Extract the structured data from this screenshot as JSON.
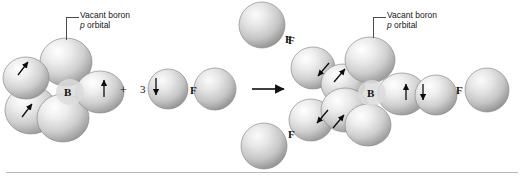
{
  "diagram": {
    "type": "orbital-reaction-diagram",
    "background": "#ffffff",
    "rule_color": "#b9b9b9"
  },
  "callouts": [
    {
      "id": "left",
      "line1": "Vacant boron",
      "line2_italic": "p",
      "line2_rest": " orbital"
    },
    {
      "id": "right",
      "line1": "Vacant boron",
      "line2_italic": "p",
      "line2_rest": " orbital"
    }
  ],
  "reactants": {
    "boron": {
      "symbol": "B",
      "hybridization": "sp2",
      "unpaired_lobes": 3,
      "vacant_p_orbitals": 1
    },
    "plus_sign": "+",
    "coefficient": "3",
    "fluorine": {
      "symbol": "F",
      "unpaired_electrons": 1
    }
  },
  "reaction_arrow": {
    "direction": "right",
    "color": "#111111"
  },
  "products": {
    "boron": {
      "symbol": "B"
    },
    "fluorines": [
      {
        "symbol": "F",
        "position": "top"
      },
      {
        "symbol": "F",
        "position": "upper-left"
      },
      {
        "symbol": "F",
        "position": "lower-left"
      },
      {
        "symbol": "F",
        "position": "right"
      }
    ],
    "bond_electron_pairs": 3
  },
  "electron_arrows": {
    "up_glyph": "↑",
    "down_glyph": "↓",
    "color": "#0c0c0c"
  },
  "orbital_colors": {
    "highlight": "#fdfdfd",
    "midtone": "#c9c9c9",
    "shadow": "#8f8f8f",
    "edge": "#7a7a7a"
  }
}
